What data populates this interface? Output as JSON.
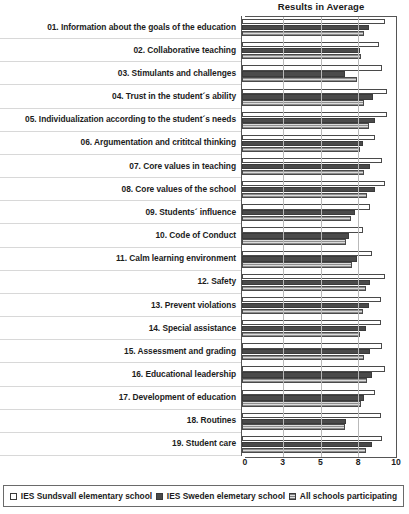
{
  "chart_data": {
    "type": "bar",
    "orientation": "horizontal",
    "title": "Results in Average",
    "xlabel": "",
    "ylabel": "",
    "xlim": [
      0,
      10
    ],
    "xticks": [
      0,
      3,
      5,
      8,
      10
    ],
    "grid": true,
    "legend_position": "bottom",
    "categories": [
      "01. Information about the goals of the education",
      "02. Collaborative teaching",
      "03. Stimulants and challenges",
      "04. Trust in the student´s ability",
      "05. Individualization according to the student´s needs",
      "06. Argumentation and crititcal thinking",
      "07. Core values in teaching",
      "08. Core values of the school",
      "09. Students´ influence",
      "10. Code of Conduct",
      "11. Calm learning environment",
      "12. Safety",
      "13. Prevent violations",
      "14. Special assistance",
      "15. Assessment and grading",
      "16. Educational leadership",
      "17. Development of education",
      "18. Routines",
      "19. Student care"
    ],
    "series": [
      {
        "name": "IES Sundsvall elementary school",
        "color": "#ffffff",
        "values": [
          9.5,
          9.1,
          9.3,
          9.6,
          9.6,
          8.8,
          9.3,
          9.5,
          8.5,
          8.0,
          8.6,
          9.5,
          9.2,
          9.2,
          9.3,
          9.5,
          8.8,
          9.2,
          9.3
        ]
      },
      {
        "name": "IES Sweden elemetary school",
        "color": "#4a4a4a",
        "values": [
          8.4,
          7.8,
          6.8,
          8.7,
          8.8,
          8.0,
          8.5,
          8.8,
          7.5,
          7.1,
          7.6,
          8.5,
          8.4,
          8.2,
          8.5,
          8.6,
          8.1,
          6.9,
          8.6
        ]
      },
      {
        "name": "All schools participating",
        "color": "#c9c9c9",
        "values": [
          8.1,
          7.9,
          7.6,
          8.1,
          8.4,
          7.8,
          8.1,
          8.3,
          7.2,
          6.9,
          7.3,
          8.2,
          8.0,
          7.8,
          8.1,
          8.3,
          7.9,
          6.8,
          8.2
        ]
      }
    ]
  }
}
